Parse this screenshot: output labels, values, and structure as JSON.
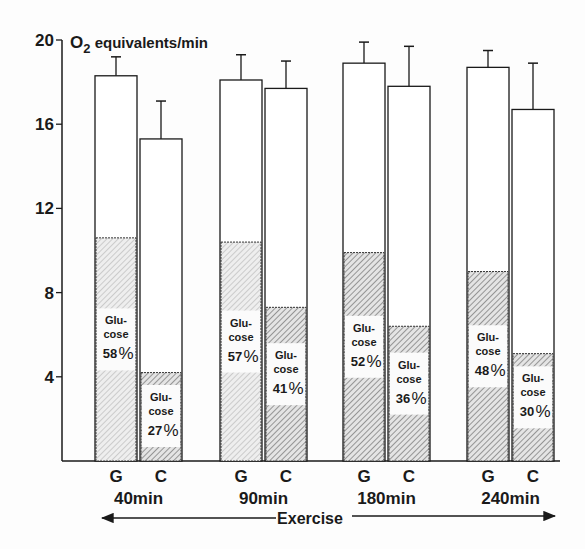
{
  "chart_data": {
    "type": "bar",
    "title": "",
    "ylabel": "O2 equivalents/min",
    "ylabel_main": "O",
    "ylabel_sub": "2",
    "ylabel_rest": " equivalents/min",
    "xlabel": "Exercise",
    "ylim": [
      0,
      20
    ],
    "yticks": [
      4,
      8,
      12,
      16,
      20
    ],
    "ytick_labels": [
      "4",
      "8",
      "12",
      "16",
      "20"
    ],
    "grid": false,
    "legend": "none",
    "categories": [
      "40min",
      "90min",
      "180min",
      "240min"
    ],
    "bar_letters": [
      "G",
      "C"
    ],
    "segment_label_line1": "Glu-",
    "segment_label_line2": "cose",
    "series": [
      {
        "name": "G",
        "total": [
          18.3,
          18.1,
          18.9,
          18.7
        ],
        "error_top": [
          19.2,
          19.3,
          19.9,
          19.5
        ],
        "glucose": [
          10.6,
          10.4,
          9.9,
          9.0
        ],
        "glucose_pct": [
          "58",
          "57",
          "52",
          "48"
        ]
      },
      {
        "name": "C",
        "total": [
          15.3,
          17.7,
          17.8,
          16.7
        ],
        "error_top": [
          17.1,
          19.0,
          19.7,
          18.9
        ],
        "glucose": [
          4.2,
          7.3,
          6.4,
          5.1
        ],
        "glucose_pct": [
          "27",
          "41",
          "36",
          "30"
        ]
      }
    ]
  }
}
